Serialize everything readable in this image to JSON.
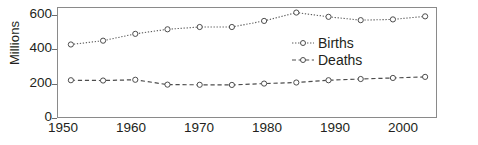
{
  "chart_data": {
    "type": "line",
    "title": "",
    "xlabel": "",
    "ylabel": "Millions",
    "x": [
      1950,
      1955,
      1960,
      1965,
      1970,
      1975,
      1980,
      1985,
      1990,
      1995,
      2000,
      2005
    ],
    "xlim": [
      1948,
      2007
    ],
    "ylim": [
      0,
      730
    ],
    "xticks": [
      1950,
      1960,
      1970,
      1980,
      1990,
      2000
    ],
    "xtick_labels": [
      "1950",
      "1960",
      "1970",
      "1980",
      "1990",
      "2000"
    ],
    "yticks": [
      0,
      200,
      400,
      600
    ],
    "ytick_labels": [
      "0",
      "200",
      "400",
      "600"
    ],
    "grid": false,
    "legend_position": "center-right-inside",
    "series": [
      {
        "name": "Births",
        "linestyle": "dotted",
        "marker": "open-circle",
        "color": "#5a5a5a",
        "values": [
          490,
          515,
          560,
          590,
          605,
          605,
          645,
          700,
          672,
          650,
          655,
          675
        ]
      },
      {
        "name": "Deaths",
        "linestyle": "dashed",
        "marker": "open-circle",
        "color": "#4d4d4d",
        "values": [
          255,
          253,
          258,
          226,
          225,
          224,
          233,
          240,
          255,
          263,
          270,
          277
        ]
      }
    ]
  },
  "axis": {
    "y_label": "Millions",
    "y_ticks": [
      "600",
      "400",
      "200",
      "0"
    ],
    "x_ticks": [
      "1950",
      "1960",
      "1970",
      "1980",
      "1990",
      "2000"
    ]
  },
  "legend": {
    "items": [
      {
        "label": "Births"
      },
      {
        "label": "Deaths"
      }
    ]
  }
}
